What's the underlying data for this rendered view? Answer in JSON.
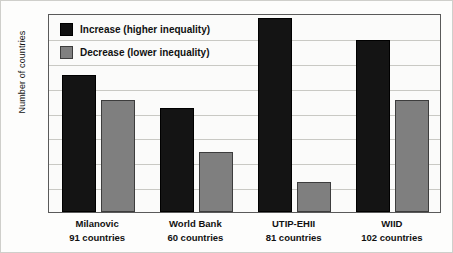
{
  "chart_data": {
    "type": "bar",
    "title": "",
    "subtitle": "",
    "xlabel": "",
    "ylabel": "Number of countries",
    "ylim": [
      0,
      80
    ],
    "ytick_labels": [
      "0",
      "10",
      "20",
      "30",
      "40",
      "50",
      "60",
      "70",
      "80"
    ],
    "ytick_values": [
      0,
      10,
      20,
      30,
      40,
      50,
      60,
      70,
      80
    ],
    "grid": true,
    "legend_position": "top-left",
    "categories": [
      "Milanovic",
      "World Bank",
      "UTIP-EHII",
      "WIID"
    ],
    "category_sublabels": [
      "91 countries",
      "60 countries",
      "81 countries",
      "102 countries"
    ],
    "series": [
      {
        "name": "Increase (higher inequality)",
        "color": "#111111",
        "values": [
          55,
          42,
          78,
          69
        ]
      },
      {
        "name": "Decrease (lower inequality)",
        "color": "#808080",
        "values": [
          45,
          24,
          12,
          45
        ]
      }
    ]
  },
  "legend": {
    "items": [
      {
        "label": "Increase (higher inequality)",
        "swatch": "increase-swatch"
      },
      {
        "label": "Decrease (lower inequality)",
        "swatch": "decrease-swatch"
      }
    ]
  },
  "axis": {
    "y_title": "Number of countries"
  }
}
